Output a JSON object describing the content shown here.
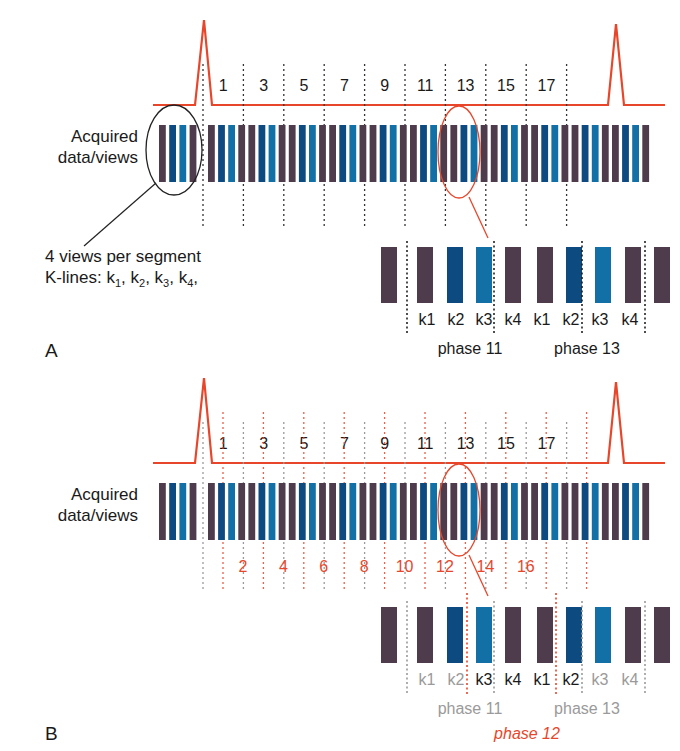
{
  "colors": {
    "ecg": "#e8462a",
    "bar_k14": "#4e3b4c",
    "bar_k2": "#0d4a80",
    "bar_k3": "#1270a6",
    "text": "#1a1a1a",
    "muted": "#9a9a9a",
    "accent_red": "#e8462a"
  },
  "panel_a": {
    "label": "A",
    "acquired_label_line1": "Acquired",
    "acquired_label_line2": "data/views",
    "phase_numbers": [
      "1",
      "3",
      "5",
      "7",
      "9",
      "11",
      "13",
      "15",
      "17"
    ],
    "annotation_line1": "4 views per segment",
    "annotation_line2_prefix": "K-lines: ",
    "annotation_klines": [
      "k1",
      "k2",
      "k3",
      "k4"
    ],
    "detail_klabels": [
      "k1",
      "k2",
      "k3",
      "k4",
      "k1",
      "k2",
      "k3",
      "k4"
    ],
    "detail_phase_left": "phase 11",
    "detail_phase_right": "phase 13"
  },
  "panel_b": {
    "label": "B",
    "acquired_label_line1": "Acquired",
    "acquired_label_line2": "data/views",
    "phase_numbers_odd": [
      "1",
      "3",
      "5",
      "7",
      "9",
      "11",
      "13",
      "15",
      "17"
    ],
    "phase_numbers_even": [
      "2",
      "4",
      "6",
      "8",
      "10",
      "12",
      "14",
      "16"
    ],
    "detail_klabels": [
      "k1",
      "k2",
      "k3",
      "k4",
      "k1",
      "k2",
      "k3",
      "k4"
    ],
    "detail_phase_left": "phase 11",
    "detail_phase_right": "phase 13",
    "detail_phase_center": "phase 12"
  }
}
